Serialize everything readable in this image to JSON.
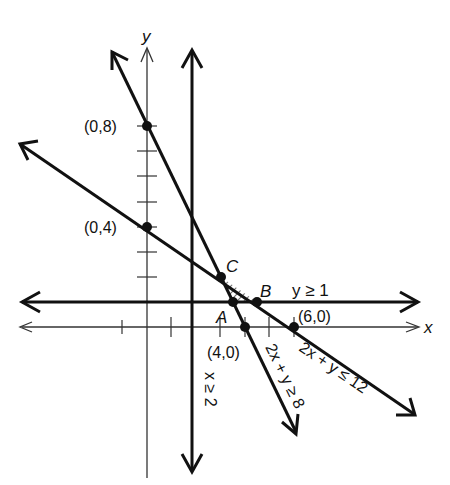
{
  "axes": {
    "x_label": "x",
    "y_label": "y",
    "origin_px": [
      147,
      327
    ],
    "px_per_unit_x": 24.5,
    "px_per_unit_y": 25.2
  },
  "points": [
    {
      "name": "y-intercept-8",
      "label": "(0,8)",
      "x": 0,
      "y": 8
    },
    {
      "name": "y-intercept-4",
      "label": "(0,4)",
      "x": 0,
      "y": 4
    },
    {
      "name": "x-intercept-4",
      "label": "(4,0)",
      "x": 4,
      "y": 0
    },
    {
      "name": "x-intercept-6",
      "label": "(6,0)",
      "x": 6,
      "y": 0
    },
    {
      "name": "vertex-A",
      "label": "A",
      "x": 3.5,
      "y": 1
    },
    {
      "name": "vertex-B",
      "label": "B",
      "x": 4.5,
      "y": 1
    },
    {
      "name": "vertex-C",
      "label": "C",
      "x": 3,
      "y": 2
    }
  ],
  "constraints": [
    {
      "name": "x-ge-2",
      "label": "x ≥ 2"
    },
    {
      "name": "y-ge-1",
      "label": "y ≥ 1"
    },
    {
      "name": "2x-plus-y-ge-8",
      "label": "2x + y ≥ 8"
    },
    {
      "name": "2x-plus-y-le-12",
      "label": "2x + y ≤ 12"
    }
  ],
  "colors": {
    "ink": "#111111",
    "axis": "#333333",
    "background": "#ffffff"
  }
}
